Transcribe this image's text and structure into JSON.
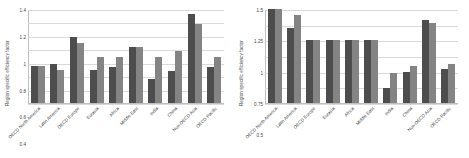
{
  "figure": {
    "background": "#ffffff",
    "series_colors": {
      "series1": "#4d4d4d",
      "series2": "#848484"
    }
  },
  "panels": [
    {
      "name": "left-panel",
      "ylabel": "Region specific efficiency factor",
      "yticks": [
        "0",
        "0.2",
        "0.4",
        "0.6",
        "0.8",
        "1",
        "1.2",
        "1.4"
      ]
    },
    {
      "name": "right-panel",
      "ylabel": "Region specific efficiency  factor",
      "yticks": [
        "0",
        "0.25",
        "0.5",
        "0.75",
        "1",
        "1.25",
        "1.5"
      ]
    }
  ],
  "chart_data": [
    {
      "type": "bar",
      "title": "",
      "xlabel": "",
      "ylabel": "Region specific efficiency factor",
      "ylim": [
        0,
        1.4
      ],
      "yticks": [
        0,
        0.2,
        0.4,
        0.6,
        0.8,
        1,
        1.2,
        1.4
      ],
      "grid": true,
      "legend": "none",
      "categories": [
        "OECD North America",
        "Latin America",
        "OECD Europe",
        "Eurasia",
        "Africa",
        "Middle East",
        "India",
        "China",
        "Non-OECD Asia",
        "OECD Pacific"
      ],
      "series": [
        {
          "name": "series1",
          "color": "#4d4d4d",
          "values": [
            0.55,
            0.58,
            0.99,
            0.49,
            0.54,
            0.83,
            0.36,
            0.48,
            1.32,
            0.53
          ]
        },
        {
          "name": "series2",
          "color": "#848484",
          "values": [
            0.55,
            0.49,
            0.89,
            0.69,
            0.69,
            0.83,
            0.68,
            0.78,
            1.18,
            0.68
          ]
        }
      ]
    },
    {
      "type": "bar",
      "title": "",
      "xlabel": "",
      "ylabel": "Region specific efficiency  factor",
      "ylim": [
        0,
        1.5
      ],
      "yticks": [
        0,
        0.25,
        0.5,
        0.75,
        1,
        1.25,
        1.5
      ],
      "grid": true,
      "legend": "none",
      "categories": [
        "OECD North America",
        "Latin America",
        "OECD Europe",
        "Eurasia",
        "Africa",
        "Middle East",
        "India",
        "China",
        "Non-OECD Asia",
        "OECD Pacific"
      ],
      "series": [
        {
          "name": "series1",
          "color": "#4d4d4d",
          "values": [
            1.5,
            1.2,
            1.0,
            1.0,
            1.0,
            1.0,
            0.24,
            0.49,
            1.33,
            0.54
          ]
        },
        {
          "name": "series2",
          "color": "#848484",
          "values": [
            1.5,
            1.4,
            1.0,
            1.0,
            1.0,
            1.0,
            0.48,
            0.59,
            1.28,
            0.63
          ]
        }
      ]
    }
  ]
}
